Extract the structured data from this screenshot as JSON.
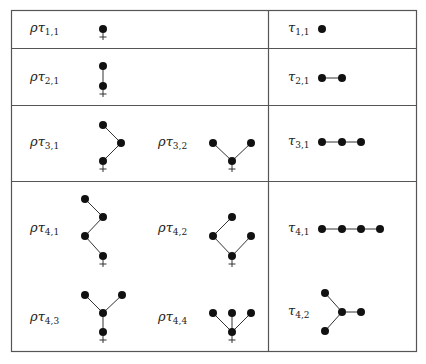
{
  "table": {
    "border_color": "#555555",
    "node_color": "#111111",
    "edge_color": "#333333"
  },
  "left_column": {
    "rows": [
      {
        "trees": [
          {
            "label_base": "ρτ",
            "label_sub": "1,1"
          }
        ]
      },
      {
        "trees": [
          {
            "label_base": "ρτ",
            "label_sub": "2,1"
          }
        ]
      },
      {
        "trees": [
          {
            "label_base": "ρτ",
            "label_sub": "3,1"
          },
          {
            "label_base": "ρτ",
            "label_sub": "3,2"
          }
        ]
      },
      {
        "trees": [
          {
            "label_base": "ρτ",
            "label_sub": "4,1"
          },
          {
            "label_base": "ρτ",
            "label_sub": "4,2"
          },
          {
            "label_base": "ρτ",
            "label_sub": "4,3"
          },
          {
            "label_base": "ρτ",
            "label_sub": "4,4"
          }
        ]
      }
    ]
  },
  "right_column": {
    "rows": [
      {
        "trees": [
          {
            "label_base": "τ",
            "label_sub": "1,1"
          }
        ]
      },
      {
        "trees": [
          {
            "label_base": "τ",
            "label_sub": "2,1"
          }
        ]
      },
      {
        "trees": [
          {
            "label_base": "τ",
            "label_sub": "3,1"
          }
        ]
      },
      {
        "trees": [
          {
            "label_base": "τ",
            "label_sub": "4,1"
          },
          {
            "label_base": "τ",
            "label_sub": "4,2"
          }
        ]
      }
    ]
  },
  "root_marker": "+"
}
